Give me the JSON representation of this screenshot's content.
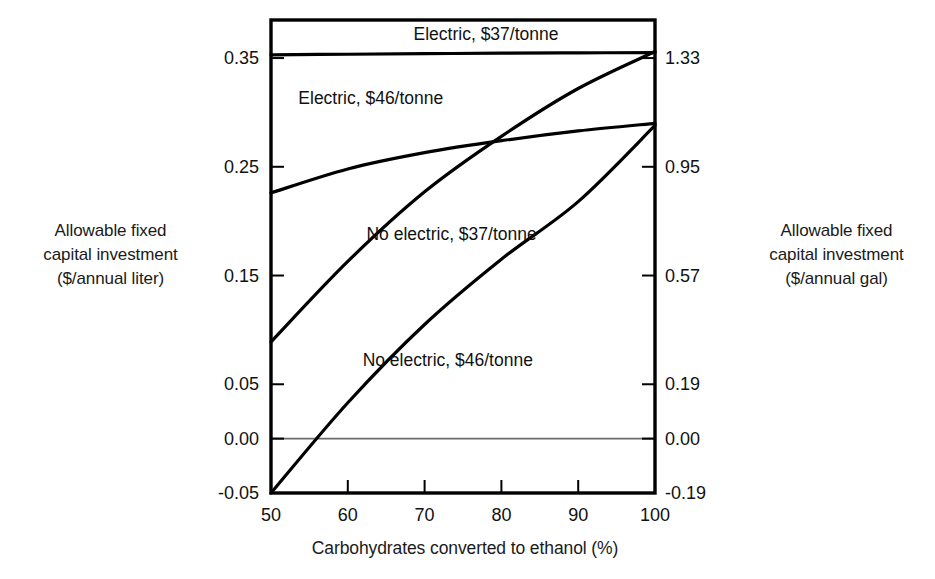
{
  "chart_data": {
    "type": "line",
    "title": "",
    "xlabel": "Carbohydrates converted to ethanol (%)",
    "ylabel": "Allowable fixed\ncapital investment\n($/annual liter)",
    "ylabel_right": "Allowable fixed\ncapital investment\n($/annual gal)",
    "xlim": [
      50,
      100
    ],
    "ylim": [
      -0.05,
      0.385
    ],
    "ylim_right": [
      -0.19,
      1.457
    ],
    "xticks": [
      50,
      60,
      70,
      80,
      90,
      100
    ],
    "xticklabels": [
      "50",
      "60",
      "70",
      "80",
      "90",
      "100"
    ],
    "yticks": [
      0.35,
      0.25,
      0.15,
      0.05,
      0.0,
      -0.05
    ],
    "yticklabels": [
      "0.35",
      "0.25",
      "0.15",
      "0.05",
      "0.00",
      "-0.05"
    ],
    "yticks_right": [
      1.33,
      0.95,
      0.57,
      0.19,
      0.0,
      -0.19
    ],
    "yticklabels_right": [
      "1.33",
      "0.95",
      "0.57",
      "0.19",
      "0.00",
      "-0.19"
    ],
    "grid": false,
    "zero_line": true,
    "legend_position": "inline-annotations",
    "series": [
      {
        "name": "Electric, $37/tonne",
        "x": [
          50,
          60,
          70,
          80,
          90,
          100
        ],
        "values": [
          0.353,
          0.3535,
          0.354,
          0.3545,
          0.3548,
          0.355
        ],
        "label_x": 78,
        "label_y": 0.372
      },
      {
        "name": "Electric, $46/tonne",
        "x": [
          50,
          60,
          70,
          80,
          90,
          100
        ],
        "values": [
          0.226,
          0.248,
          0.263,
          0.274,
          0.283,
          0.29
        ],
        "label_x": 63,
        "label_y": 0.313
      },
      {
        "name": "No electric, $37/tonne",
        "x": [
          50,
          60,
          70,
          80,
          90,
          100
        ],
        "values": [
          0.089,
          0.163,
          0.227,
          0.278,
          0.322,
          0.356
        ],
        "label_x": 73.5,
        "label_y": 0.188
      },
      {
        "name": "No electric, $46/tonne",
        "x": [
          50,
          60,
          70,
          80,
          90,
          100
        ],
        "values": [
          -0.05,
          0.033,
          0.105,
          0.165,
          0.218,
          0.288
        ],
        "label_x": 73,
        "label_y": 0.072
      }
    ]
  },
  "axes": {
    "left_title": "Allowable fixed\ncapital investment\n($/annual liter)",
    "right_title": "Allowable fixed\ncapital investment\n($/annual gal)",
    "x_title": "Carbohydrates converted to ethanol (%)"
  },
  "colors": {
    "line": "#000000",
    "axis": "#000000",
    "zero_line": "#6b6b6b",
    "background": "#ffffff"
  }
}
